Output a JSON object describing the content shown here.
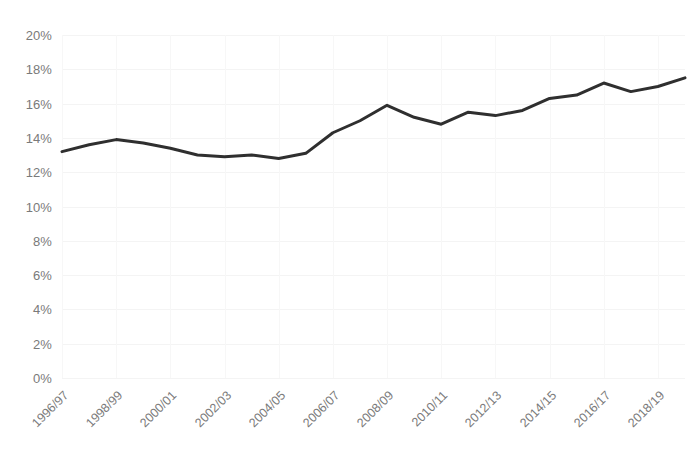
{
  "chart_data": {
    "type": "line",
    "title": "",
    "subtitle": "",
    "xlabel": "",
    "ylabel": "",
    "grid": true,
    "legend": false,
    "legend_position": "none",
    "line_color": "#2f2f2f",
    "axis_text_color": "#7a7a7a",
    "ylim": [
      0,
      20
    ],
    "y_tick_labels": [
      "20%",
      "18%",
      "16%",
      "14%",
      "12%",
      "10%",
      "8%",
      "6%",
      "4%",
      "2%",
      "0%"
    ],
    "y_tick_values": [
      20,
      18,
      16,
      14,
      12,
      10,
      8,
      6,
      4,
      2,
      0
    ],
    "x_tick_labels": [
      "1996/97",
      "1998/99",
      "2000/01",
      "2002/03",
      "2004/05",
      "2006/07",
      "2008/09",
      "2010/11",
      "2012/13",
      "2014/15",
      "2016/17",
      "2018/19"
    ],
    "categories": [
      "1996/97",
      "1997/98",
      "1998/99",
      "1999/00",
      "2000/01",
      "2001/02",
      "2002/03",
      "2003/04",
      "2004/05",
      "2005/06",
      "2006/07",
      "2007/08",
      "2008/09",
      "2009/10",
      "2010/11",
      "2011/12",
      "2012/13",
      "2013/14",
      "2014/15",
      "2015/16",
      "2016/17",
      "2017/18",
      "2018/19",
      "2019/20"
    ],
    "values": [
      13.2,
      13.6,
      13.9,
      13.7,
      13.4,
      13.0,
      12.9,
      13.0,
      12.8,
      13.1,
      14.3,
      15.0,
      15.9,
      15.2,
      14.8,
      15.5,
      15.3,
      15.6,
      16.3,
      16.5,
      17.2,
      16.7,
      17.0,
      17.5
    ]
  },
  "caption": {
    "text": ""
  }
}
